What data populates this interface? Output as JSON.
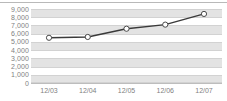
{
  "chart_data": {
    "type": "line",
    "title": "",
    "subtitle": "",
    "xlabel": "",
    "ylabel": "",
    "categories": [
      "12/03",
      "12/04",
      "12/05",
      "12/06",
      "12/07"
    ],
    "series": [
      {
        "name": "series-1",
        "values": [
          5500,
          5600,
          6600,
          7100,
          8400
        ]
      }
    ],
    "ylim": [
      0,
      9000
    ],
    "ytick_values": [
      9000,
      8000,
      7000,
      6000,
      5000,
      4000,
      3000,
      2000,
      1000,
      0
    ],
    "ytick_labels": [
      "9,000",
      "8,000",
      "7,000",
      "6,000",
      "5,000",
      "4,000",
      "3,000",
      "2,000",
      "1,000",
      "0"
    ],
    "grid": true,
    "legend": null,
    "annotations": [],
    "colors": {
      "line": "#3a3a3a",
      "marker_fill": "#ffffff",
      "marker_stroke": "#4a4a4a",
      "band": "#e3e3e3",
      "gridline": "#d2d2d2",
      "axis": "#bdbdbd",
      "tick_text": "#7f7f7f",
      "background": "#ffffff"
    }
  }
}
